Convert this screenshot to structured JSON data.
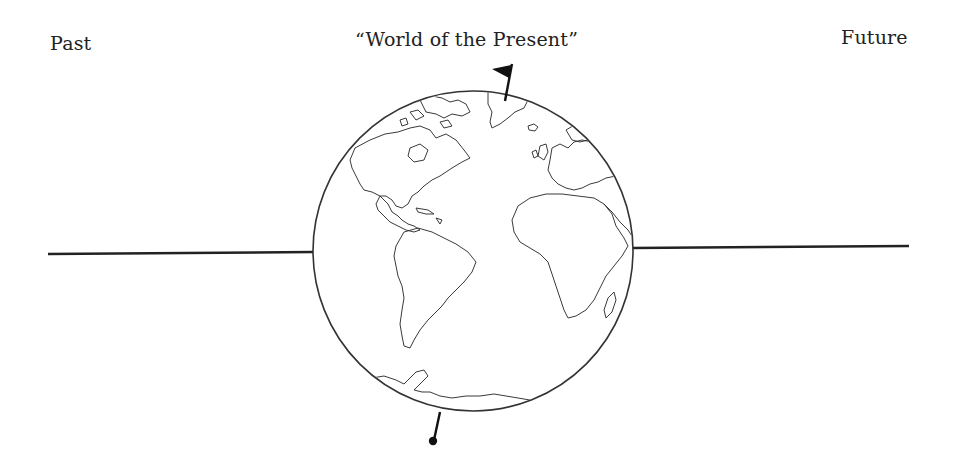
{
  "labels": {
    "past": "Past",
    "present": "“World of the Present”",
    "future": "Future"
  },
  "diagram": {
    "globe": {
      "cx": 473,
      "cy": 251,
      "r": 160,
      "stroke": "#333333"
    },
    "timeline_left": {
      "x1": 48,
      "y1": 254,
      "x2": 313,
      "y2": 252
    },
    "timeline_right": {
      "x1": 633,
      "y1": 248,
      "x2": 909,
      "y2": 246
    },
    "flag_icon": "flag",
    "pin_icon": "pin",
    "line_color": "#222222"
  }
}
